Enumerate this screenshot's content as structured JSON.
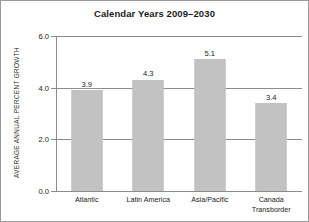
{
  "chart_data": {
    "type": "bar",
    "title": "Calendar Years 2009–2030",
    "xlabel": "",
    "ylabel": "AVERAGE ANNUAL PERCENT GROWTH",
    "categories": [
      "Atlantic",
      "Latin America",
      "Asia/Pacific",
      "Canada Transborder"
    ],
    "category_lines": [
      [
        "Atlantic"
      ],
      [
        "Latin America"
      ],
      [
        "Asia/Pacific"
      ],
      [
        "Canada",
        "Transborder"
      ]
    ],
    "values": [
      3.9,
      4.3,
      5.1,
      3.4
    ],
    "value_labels": [
      "3.9",
      "4.3",
      "5.1",
      "3.4"
    ],
    "ylim": [
      0.0,
      6.0
    ],
    "yticks": [
      0.0,
      2.0,
      4.0,
      6.0
    ],
    "ytick_labels": [
      "0.0",
      "2.0",
      "4.0",
      "6.0"
    ],
    "grid": true,
    "legend": false,
    "bar_color": "#c2c2c2",
    "grid_color": "#8c8c8c",
    "text_color": "#1b1b1b",
    "background": "#ffffff"
  }
}
